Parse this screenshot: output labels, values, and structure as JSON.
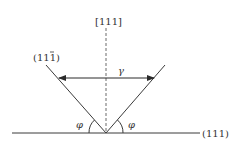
{
  "diagram": {
    "labels": {
      "direction_top": "[111]",
      "plane_left": "(11",
      "plane_left_bar_digit": "1",
      "plane_left_close": ")",
      "plane_bottom": "(111)",
      "gamma": "γ",
      "phi_left": "φ",
      "phi_right": "φ"
    },
    "colors": {
      "line": "#3a3a3a",
      "dashed": "#6a6a6a",
      "text": "#333333"
    }
  }
}
